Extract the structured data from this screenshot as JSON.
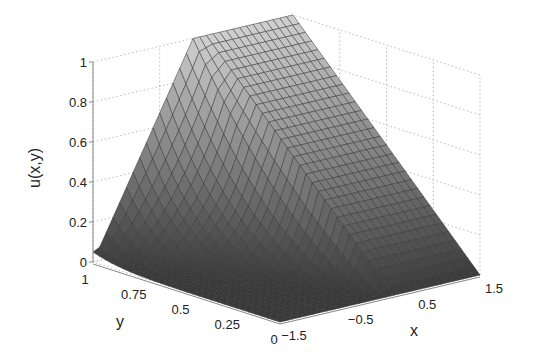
{
  "chart_data": {
    "type": "surface",
    "title": "",
    "xlabel": "x",
    "ylabel": "y",
    "zlabel": "u(x,y)",
    "xlim": [
      -1.5,
      1.5
    ],
    "ylim": [
      0,
      1
    ],
    "zlim": [
      0,
      1
    ],
    "x_ticks": [
      -1.5,
      -0.5,
      0.5,
      1.5
    ],
    "x_tick_labels": [
      "−1.5",
      "−0.5",
      "0.5",
      "1.5"
    ],
    "y_ticks": [
      1,
      0.75,
      0.5,
      0.25,
      0
    ],
    "y_tick_labels": [
      "1",
      "0.75",
      "0.5",
      "0.25",
      "0"
    ],
    "z_ticks": [
      0,
      0.2,
      0.4,
      0.6,
      0.8,
      1
    ],
    "z_tick_labels": [
      "0",
      "0.2",
      "0.4",
      "0.6",
      "0.8",
      "1"
    ],
    "grid": true,
    "colormap": "gray",
    "mesh": {
      "nx": 30,
      "ny": 30
    },
    "sample_values": [
      {
        "x": -1.5,
        "y": 1,
        "u": 0.05
      },
      {
        "x": -0.5,
        "y": 1,
        "u": 0.55
      },
      {
        "x": 0,
        "y": 1,
        "u": 1.0
      },
      {
        "x": 1.5,
        "y": 1,
        "u": 1.0
      },
      {
        "x": 1.5,
        "y": 0.5,
        "u": 0.5
      },
      {
        "x": 1.5,
        "y": 0,
        "u": 0.0
      },
      {
        "x": -1.5,
        "y": 0,
        "u": 0.0
      }
    ]
  },
  "colors": {
    "background": "#ffffff",
    "axis": "#888888",
    "grid": "#bbbbbb",
    "mesh_line": "#333333",
    "surface_high": "#d0d0d0",
    "surface_low": "#3a3a3a"
  }
}
